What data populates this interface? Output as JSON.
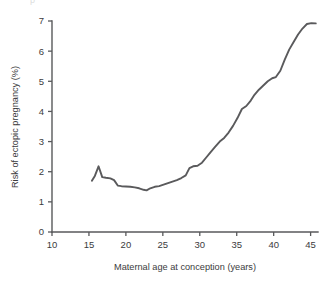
{
  "figure": {
    "background_color": "#ffffff",
    "line_color": "#5a5a5c",
    "axis_color": "#58595b",
    "text_color": "#3b3b3d",
    "clipped_top_text": "p"
  },
  "chart_data": {
    "type": "line",
    "title": "",
    "xlabel": "Maternal age at conception (years)",
    "ylabel": "Risk of ectopic pregnancy (%)",
    "xlim": [
      10,
      46
    ],
    "ylim": [
      0,
      7
    ],
    "xticks": [
      10,
      15,
      20,
      25,
      30,
      35,
      40,
      45
    ],
    "xtick_labels": [
      "10",
      "15",
      "20",
      "25",
      "30",
      "35",
      "40",
      "45"
    ],
    "yticks": [
      0,
      1,
      2,
      3,
      4,
      5,
      6,
      7
    ],
    "ytick_labels": [
      "0",
      "1",
      "2",
      "3",
      "4",
      "5",
      "6",
      "7"
    ],
    "grid": false,
    "legend": false,
    "series": [
      {
        "name": "Risk of ectopic pregnancy",
        "color": "#5a5a5c",
        "x": [
          15.4,
          15.8,
          16.3,
          16.8,
          17.3,
          17.9,
          18.4,
          18.9,
          19.4,
          20.0,
          20.6,
          21.2,
          21.8,
          22.4,
          22.8,
          23.3,
          23.9,
          24.5,
          25.1,
          25.7,
          26.3,
          26.9,
          27.5,
          28.1,
          28.6,
          29.1,
          29.7,
          30.3,
          30.9,
          31.5,
          32.1,
          32.7,
          33.3,
          33.9,
          34.5,
          35.1,
          35.7,
          36.3,
          36.9,
          37.4,
          38.0,
          38.6,
          39.2,
          39.8,
          40.3,
          40.9,
          41.5,
          42.1,
          42.7,
          43.3,
          43.9,
          44.5,
          45.1,
          45.7
        ],
        "y": [
          1.7,
          1.86,
          2.18,
          1.82,
          1.8,
          1.78,
          1.72,
          1.54,
          1.52,
          1.51,
          1.5,
          1.48,
          1.45,
          1.4,
          1.38,
          1.45,
          1.5,
          1.52,
          1.57,
          1.62,
          1.67,
          1.72,
          1.79,
          1.88,
          2.12,
          2.18,
          2.2,
          2.3,
          2.48,
          2.66,
          2.83,
          3.0,
          3.12,
          3.3,
          3.52,
          3.78,
          4.08,
          4.18,
          4.36,
          4.55,
          4.72,
          4.86,
          5.0,
          5.1,
          5.14,
          5.35,
          5.72,
          6.05,
          6.3,
          6.55,
          6.75,
          6.9,
          6.93,
          6.92
        ]
      }
    ]
  }
}
